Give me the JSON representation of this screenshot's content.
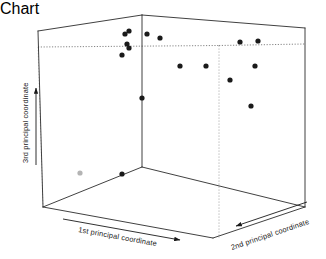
{
  "chart_data": {
    "type": "scatter",
    "title": "",
    "subtitle": "",
    "projection": "3d",
    "grid": false,
    "legend": null,
    "xlabel": "1st principal coordinate",
    "ylabel": "2nd principal coordinate",
    "zlabel": "3rd principal coordinate",
    "xticks": [],
    "yticks": [],
    "zticks": [],
    "axis_label_x": "1st principal coordinate",
    "axis_label_y": "2nd principal coordinate",
    "axis_label_z": "3rd principal coordinate",
    "axis_arrow_x_direction": "right",
    "axis_arrow_y_direction": "left",
    "axis_arrow_z_direction": "up",
    "point_color": "#1a1a1a",
    "outlier_color": "#b4b4b4",
    "box_color": "#2b2b2b",
    "hidden_edge_style": "dotted",
    "points": [
      {
        "px": 125,
        "py": 34,
        "color": "#1a1a1a"
      },
      {
        "px": 129,
        "py": 31,
        "color": "#1a1a1a"
      },
      {
        "px": 127,
        "py": 44,
        "color": "#1a1a1a"
      },
      {
        "px": 129,
        "py": 48,
        "color": "#1a1a1a"
      },
      {
        "px": 122,
        "py": 55,
        "color": "#1a1a1a"
      },
      {
        "px": 147,
        "py": 34,
        "color": "#1a1a1a"
      },
      {
        "px": 160,
        "py": 38,
        "color": "#1a1a1a"
      },
      {
        "px": 180,
        "py": 66,
        "color": "#1a1a1a"
      },
      {
        "px": 206,
        "py": 66,
        "color": "#1a1a1a"
      },
      {
        "px": 240,
        "py": 42,
        "color": "#1a1a1a"
      },
      {
        "px": 258,
        "py": 41,
        "color": "#1a1a1a"
      },
      {
        "px": 255,
        "py": 66,
        "color": "#1a1a1a"
      },
      {
        "px": 230,
        "py": 80,
        "color": "#1a1a1a"
      },
      {
        "px": 251,
        "py": 106,
        "color": "#1a1a1a"
      },
      {
        "px": 142,
        "py": 98,
        "color": "#1a1a1a"
      },
      {
        "px": 122,
        "py": 174,
        "color": "#1a1a1a"
      },
      {
        "px": 80,
        "py": 173,
        "color": "#b4b4b4"
      }
    ],
    "box_vertices": {
      "top_apex": [
        142,
        15
      ],
      "top_back_left": [
        38,
        31
      ],
      "top_back_right": [
        305,
        28
      ],
      "bottom_left": [
        43,
        207
      ],
      "bottom_front": [
        213,
        238
      ],
      "bottom_right": [
        305,
        207
      ],
      "mid_front_bottom": [
        142,
        167
      ],
      "back_left_dotted": [
        38,
        47
      ],
      "back_right_dotted": [
        305,
        44
      ],
      "dotted_vertical_x": 219
    }
  },
  "figure": {
    "background_color": "#ffffff",
    "width": 326,
    "height": 259
  }
}
